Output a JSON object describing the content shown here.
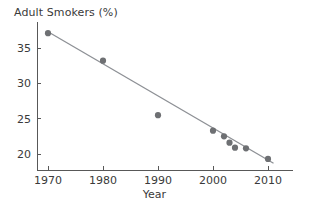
{
  "chart_data": {
    "type": "scatter",
    "title": "Adult Smokers (%)",
    "xlabel": "Year",
    "ylabel": "Adult Smokers (%)",
    "xlim": [
      1966,
      2014
    ],
    "ylim": [
      17.8,
      38.5
    ],
    "grid": false,
    "legend": "none",
    "xticks": [
      1970,
      1980,
      1990,
      2000,
      2010
    ],
    "yticks": [
      20,
      25,
      30,
      35
    ],
    "xtick_labels": [
      "1970",
      "1980",
      "1990",
      "2000",
      "2010"
    ],
    "ytick_labels": [
      "20",
      "25",
      "30",
      "35"
    ],
    "x": [
      1970,
      1980,
      1990,
      2000,
      2002,
      2003,
      2004,
      2006,
      2010
    ],
    "y": [
      37.1,
      33.2,
      25.5,
      23.3,
      22.5,
      21.6,
      20.9,
      20.8,
      19.3
    ],
    "points": [
      {
        "x": 1970,
        "y": 37.1
      },
      {
        "x": 1980,
        "y": 33.2
      },
      {
        "x": 1990,
        "y": 25.5
      },
      {
        "x": 2000,
        "y": 23.3
      },
      {
        "x": 2002,
        "y": 22.5
      },
      {
        "x": 2003,
        "y": 21.6
      },
      {
        "x": 2004,
        "y": 20.9
      },
      {
        "x": 2006,
        "y": 20.8
      },
      {
        "x": 2010,
        "y": 19.3
      }
    ],
    "trend_line": {
      "label": "linear fit",
      "x_start": 1970,
      "y_start": 37.3,
      "x_end": 2011,
      "y_end": 18.7
    },
    "colors": {
      "marker": "#6e7073",
      "line": "#8d9095",
      "axis": "#585858",
      "text": "#3a3a3a",
      "background": "#ffffff"
    }
  }
}
